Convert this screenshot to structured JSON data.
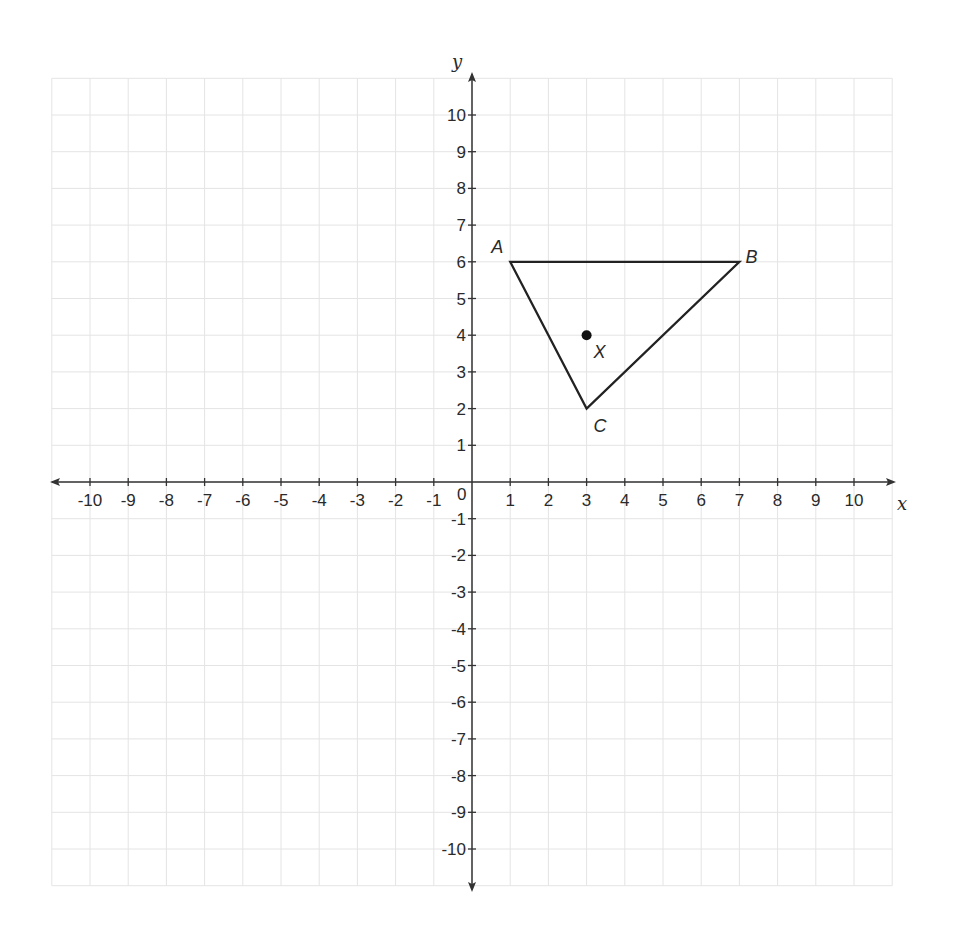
{
  "diagram": {
    "type": "coordinate-plane",
    "grid": {
      "xmin": -11,
      "xmax": 11,
      "ymin": -11,
      "ymax": 11,
      "color": "#e4e4e4"
    },
    "axes": {
      "x_label": "x",
      "y_label": "y",
      "origin_label": "0",
      "x_ticks": [
        -10,
        -9,
        -8,
        -7,
        -6,
        -5,
        -4,
        -3,
        -2,
        -1,
        1,
        2,
        3,
        4,
        5,
        6,
        7,
        8,
        9,
        10
      ],
      "y_ticks": [
        10,
        9,
        8,
        7,
        6,
        5,
        4,
        3,
        2,
        1,
        -1,
        -2,
        -3,
        -4,
        -5,
        -6,
        -7,
        -8,
        -9,
        -10
      ],
      "color": "#333333"
    },
    "triangle": {
      "vertices": [
        {
          "name": "A",
          "x": 1,
          "y": 6
        },
        {
          "name": "B",
          "x": 7,
          "y": 6
        },
        {
          "name": "C",
          "x": 3,
          "y": 2
        }
      ],
      "stroke": "#222222"
    },
    "point": {
      "name": "X",
      "x": 3,
      "y": 4,
      "color": "#111111"
    }
  }
}
